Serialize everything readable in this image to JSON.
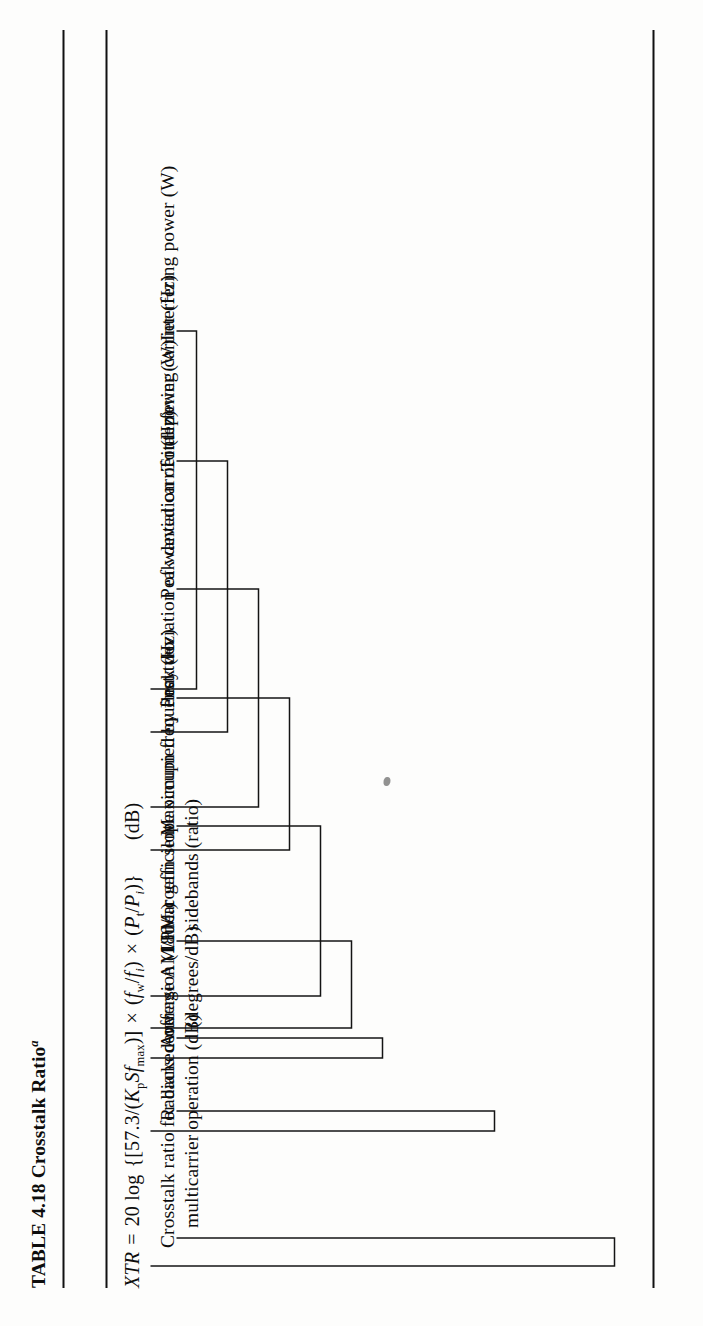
{
  "document": {
    "table_title_prefix": "TABLE 4.18",
    "table_title": "TABLE 4.18 Crosstalk Ratio",
    "table_title_superscript": "a",
    "background_color": "#fdfdfc",
    "ink_color": "#0d0d0d"
  },
  "formula": {
    "plain_text": "XTR = 20 log {[57.3/(KpSfmax)] × (fw/fi) × (Pt/Pi)}   (dB)",
    "lhs": "XTR",
    "equals": "=",
    "coefficient": "20 log",
    "open_brace": "{",
    "open_bracket": "[",
    "numerator": "57.3",
    "slash": "/",
    "denominator_open": "(",
    "denom_K": "K",
    "denom_K_sub": "p",
    "denom_S": "S",
    "denom_f": "f",
    "denom_f_sub": "max",
    "denominator_close": ")",
    "close_bracket": "]",
    "times1": "×",
    "ratio1_open": "(",
    "ratio1_num": "f",
    "ratio1_num_sub": "w",
    "ratio1_slash": "/",
    "ratio1_den": "f",
    "ratio1_den_sub": "i",
    "ratio1_close": ")",
    "times2": "×",
    "ratio2_open": "(",
    "ratio2_num": "P",
    "ratio2_num_sub": "t",
    "ratio2_slash": "/",
    "ratio2_den": "P",
    "ratio2_den_sub": "i",
    "ratio2_close": ")",
    "close_brace": "}",
    "unit": "(dB)"
  },
  "callouts": [
    {
      "id": "interfering-power",
      "line1": "Interfering power (W)",
      "line2": ""
    },
    {
      "id": "total-power",
      "line1": "Total power (W)",
      "line2": ""
    },
    {
      "id": "peak-dev-interfering",
      "line1": "Peak deviation of interfering carrier (Hz)",
      "line2": ""
    },
    {
      "id": "peak-dev-wanted",
      "line1": "Peak deviation of wanted carrier (Hz)",
      "line2": ""
    },
    {
      "id": "max-frequency",
      "line1": "Maximum frequency (Hz)",
      "line2": ""
    },
    {
      "id": "linear-gain-slope",
      "line1": "Linear gain slope occupied by first two",
      "line2": "sidebands (ratio)"
    },
    {
      "id": "am-pm-coefficient",
      "line1": "Average AM/PM coefficient",
      "line2": "(degrees/dB)"
    },
    {
      "id": "radians-conversion",
      "line1": "Radians conversion (180/π)",
      "line2": ""
    },
    {
      "id": "crosstalk-ratio",
      "line1": "Crosstalk ratio for backed-off",
      "line2": "multicarrier operation (dB)"
    }
  ]
}
